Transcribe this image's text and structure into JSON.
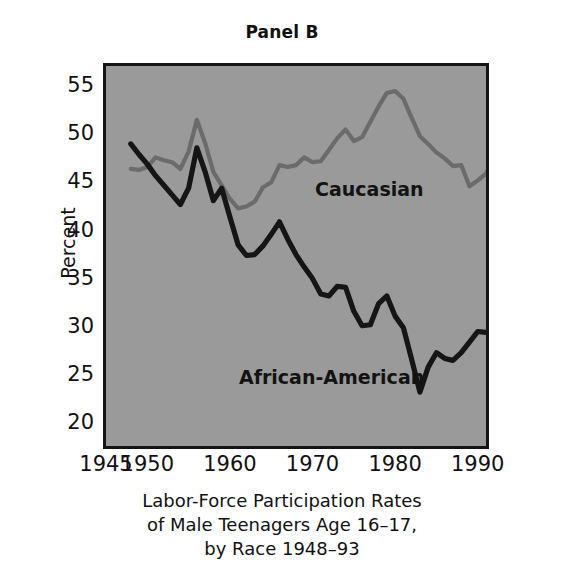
{
  "figure": {
    "panel_title": "Panel B",
    "background_color": "#9a9a9a",
    "frame_color": "#151515"
  },
  "caption": {
    "line1": "Labor-Force Participation Rates",
    "line2": "of Male Teenagers Age 16–17,",
    "line3": "by Race 1948–93"
  },
  "annotations": {
    "caucasian": "Caucasian",
    "african_american": "African-American"
  },
  "chart_data": {
    "type": "line",
    "title": "Panel B",
    "subtitle": "Labor-Force Participation Rates of Male Teenagers Age 16–17, by Race 1948–93",
    "xlabel": "",
    "ylabel": "Percent",
    "xlim": [
      1945,
      1991
    ],
    "ylim": [
      17.5,
      57
    ],
    "xticks": [
      1945,
      1950,
      1960,
      1970,
      1980,
      1990
    ],
    "xticklabels": [
      "1945",
      "1950",
      "1960",
      "1970",
      "1980",
      "1990"
    ],
    "yticks": [
      20,
      25,
      30,
      35,
      40,
      45,
      50,
      55
    ],
    "yticklabels": [
      "20",
      "25",
      "30",
      "35",
      "40",
      "45",
      "50",
      "55"
    ],
    "grid": false,
    "legend_position": "inline-annotation",
    "x": [
      1948,
      1949,
      1950,
      1951,
      1952,
      1953,
      1954,
      1955,
      1956,
      1957,
      1958,
      1959,
      1960,
      1961,
      1962,
      1963,
      1964,
      1965,
      1966,
      1967,
      1968,
      1969,
      1970,
      1971,
      1972,
      1973,
      1974,
      1975,
      1976,
      1977,
      1978,
      1979,
      1980,
      1981,
      1982,
      1983,
      1984,
      1985,
      1986,
      1987,
      1988,
      1989,
      1990,
      1991,
      1992,
      1993
    ],
    "series": [
      {
        "name": "Caucasian",
        "color": "#6b6b6b",
        "values": [
          46.3,
          46.2,
          46.5,
          47.5,
          47.2,
          47.0,
          46.3,
          48.1,
          51.4,
          49.0,
          46.0,
          44.6,
          43.2,
          42.2,
          42.4,
          42.9,
          44.4,
          44.9,
          46.7,
          46.5,
          46.7,
          47.5,
          47.0,
          47.1,
          48.3,
          49.5,
          50.4,
          49.2,
          49.6,
          51.2,
          52.8,
          54.2,
          54.4,
          53.6,
          51.6,
          49.7,
          48.9,
          48.0,
          47.4,
          46.6,
          46.7,
          44.5,
          45.1,
          45.8,
          47.5,
          50.2
        ]
      },
      {
        "name": "African-American",
        "color": "#151515",
        "values": [
          48.9,
          47.8,
          46.8,
          45.6,
          44.6,
          43.6,
          42.6,
          44.3,
          48.5,
          46.0,
          43.0,
          44.3,
          41.3,
          38.4,
          37.3,
          37.4,
          38.3,
          39.5,
          40.8,
          39.0,
          37.4,
          36.1,
          34.9,
          33.3,
          33.1,
          34.1,
          34.0,
          31.5,
          30.0,
          30.1,
          32.3,
          33.1,
          31.0,
          29.8,
          26.5,
          23.1,
          25.7,
          27.2,
          26.6,
          26.4,
          27.2,
          28.3,
          29.4,
          29.3,
          29.4,
          29.4
        ]
      }
    ]
  }
}
